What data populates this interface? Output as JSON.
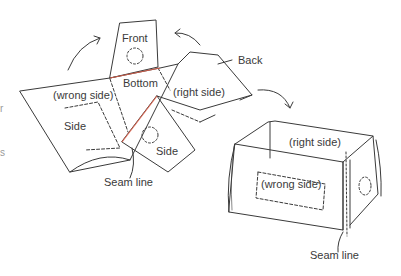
{
  "diagram": {
    "left_figure": {
      "labels": {
        "front": "Front",
        "back": "Back",
        "bottom": "Bottom",
        "wrong_side": "(wrong side)",
        "right_side": "(right side)",
        "side_left": "Side",
        "side_right": "Side",
        "seam_line": "Seam line"
      }
    },
    "right_figure": {
      "labels": {
        "right_side": "(right side)",
        "wrong_side": "(wrong side)",
        "seam_line": "Seam line"
      }
    },
    "edge_fragments": [
      "r",
      "s"
    ],
    "colors": {
      "line": "#3a3a3a",
      "seam_highlight": "#e0604a",
      "text": "#3a3a3a"
    }
  }
}
